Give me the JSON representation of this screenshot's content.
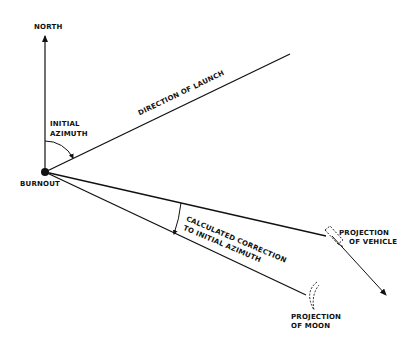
{
  "diagram": {
    "labels": {
      "north": "NORTH",
      "initial_azimuth_line1": "INITIAL",
      "initial_azimuth_line2": "AZIMUTH",
      "burnout": "BURNOUT",
      "direction_of_launch": "DIRECTION OF LAUNCH",
      "correction_line1": "CALCULATED CORRECTION",
      "correction_line2": "TO INITIAL AZIMUTH",
      "vehicle_line1": "PROJECTION",
      "vehicle_line2": "OF VEHICLE",
      "moon_line1": "PROJECTION",
      "moon_line2": "OF MOON"
    },
    "colors": {
      "ink": "#111111",
      "background": "#ffffff"
    }
  }
}
